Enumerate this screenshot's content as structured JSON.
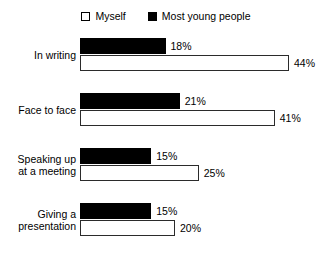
{
  "legend": {
    "entries": [
      {
        "label": "Myself",
        "swatch": "hollow",
        "color": "#ffffff"
      },
      {
        "label": "Most young people",
        "swatch": "filled",
        "color": "#000000"
      }
    ]
  },
  "chart_data": {
    "type": "bar",
    "orientation": "horizontal",
    "title": "",
    "subtitle": "",
    "xlabel": "",
    "ylabel": "",
    "xlim": [
      0,
      50
    ],
    "grid": false,
    "legend_position": "top-center",
    "value_suffix": "%",
    "categories": [
      "In writing",
      "Face to face",
      "Speaking up at a meeting",
      "Giving a presentation"
    ],
    "category_lines": [
      [
        "In writing"
      ],
      [
        "Face to face"
      ],
      [
        "Speaking up",
        "at a meeting"
      ],
      [
        "Giving a",
        "presentation"
      ]
    ],
    "series": [
      {
        "name": "Most young people",
        "color": "#000000",
        "values": [
          18,
          21,
          15,
          15
        ],
        "labels": [
          "18%",
          "21%",
          "15%",
          "15%"
        ]
      },
      {
        "name": "Myself",
        "color": "#ffffff",
        "values": [
          44,
          41,
          25,
          20
        ],
        "labels": [
          "44%",
          "41%",
          "25%",
          "20%"
        ]
      }
    ]
  },
  "scale": {
    "px_per_percent": 4.75
  }
}
